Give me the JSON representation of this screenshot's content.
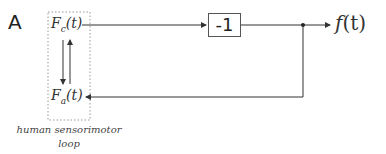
{
  "panel_label": "A",
  "nodes": {
    "fc": "Fc(t)",
    "fc_base": "F",
    "fc_sub": "c",
    "fc_arg": "(t)",
    "fa_base": "F",
    "fa_sub": "a",
    "fa_arg": "(t)",
    "gain": "-1",
    "output": "f(t)",
    "output_base": "f",
    "output_arg": "(t)"
  },
  "caption": {
    "line1": "human sensorimotor",
    "line2": "loop"
  },
  "colors": {
    "line": "#333333",
    "dotted_box": "#999999"
  }
}
